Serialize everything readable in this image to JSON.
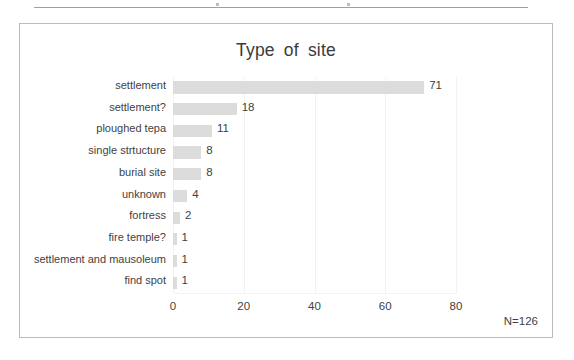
{
  "page": {
    "rule_present": true
  },
  "chart_frame": {
    "border_color": "#b9bcc2"
  },
  "annotations": {
    "sample_size_label": "N=126"
  },
  "chart_data": {
    "type": "bar",
    "orientation": "horizontal",
    "title": "Type  of  site",
    "xlabel": "",
    "ylabel": "",
    "categories": [
      "settlement",
      "settlement?",
      "ploughed tepa",
      "single strtucture",
      "burial site",
      "unknown",
      "fortress",
      "fire temple?",
      "settlement and mausoleum",
      "find spot"
    ],
    "values": [
      71,
      18,
      11,
      8,
      8,
      4,
      2,
      1,
      1,
      1
    ],
    "data_labels": [
      "71",
      "18",
      "11",
      "8",
      "8",
      "4",
      "2",
      "1",
      "1",
      "1"
    ],
    "xlim": [
      0,
      80
    ],
    "xticks": [
      0,
      20,
      40,
      60,
      80
    ],
    "xtick_labels": [
      "0",
      "20",
      "40",
      "60",
      "80"
    ],
    "grid": "vertical-only",
    "legend": "none",
    "bar_color": "#dcdcdc",
    "total": 126
  }
}
